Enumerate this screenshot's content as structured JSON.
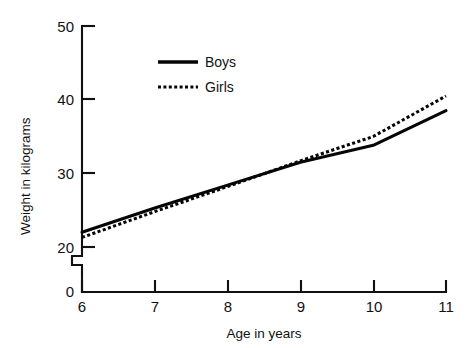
{
  "chart_data": {
    "type": "line",
    "title": "",
    "xlabel": "Age in years",
    "ylabel": "Weight in kilograms",
    "xlim": [
      6,
      11
    ],
    "ylim": [
      20,
      50
    ],
    "y_axis_zero_label": "0",
    "y_axis_break": true,
    "grid": false,
    "legend_position": "upper-left-inside",
    "x": [
      6,
      7,
      8,
      9,
      10,
      11
    ],
    "xticks": [
      "6",
      "7",
      "8",
      "9",
      "10",
      "11"
    ],
    "yticks": [
      "20",
      "30",
      "40",
      "50"
    ],
    "series": [
      {
        "name": "Boys",
        "style": "solid",
        "values": [
          22.0,
          25.3,
          28.4,
          31.5,
          33.8,
          38.5
        ]
      },
      {
        "name": "Girls",
        "style": "dotted",
        "values": [
          21.3,
          24.8,
          28.2,
          31.7,
          35.0,
          40.5
        ]
      }
    ]
  },
  "legend": {
    "items": [
      {
        "label": "Boys",
        "style": "solid"
      },
      {
        "label": "Girls",
        "style": "dotted"
      }
    ]
  },
  "axes": {
    "y_title": "Weight in kilograms",
    "x_title": "Age in years",
    "y_tick_labels": [
      "50",
      "40",
      "30",
      "20"
    ],
    "y_zero_label": "0",
    "x_tick_labels": [
      "6",
      "7",
      "8",
      "9",
      "10",
      "11"
    ]
  }
}
